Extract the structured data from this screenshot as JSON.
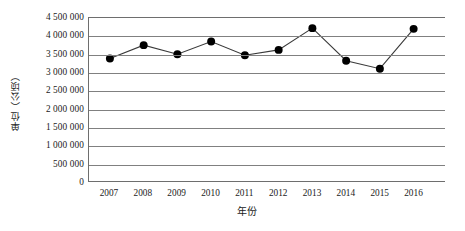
{
  "chart_data": {
    "type": "line",
    "title": "",
    "xlabel": "年份",
    "ylabel": "单位（公顷）",
    "categories": [
      "2007",
      "2008",
      "2009",
      "2010",
      "2011",
      "2012",
      "2013",
      "2014",
      "2015",
      "2016"
    ],
    "values": [
      3380000,
      3750000,
      3500000,
      3850000,
      3470000,
      3620000,
      4220000,
      3320000,
      3100000,
      4200000
    ],
    "series": [
      {
        "name": "面积",
        "values": [
          3380000,
          3750000,
          3500000,
          3850000,
          3470000,
          3620000,
          4220000,
          3320000,
          3100000,
          4200000
        ]
      }
    ],
    "ylim": [
      0,
      4500000
    ],
    "ytick_values": [
      0,
      500000,
      1000000,
      1500000,
      2000000,
      2500000,
      3000000,
      3500000,
      4000000,
      4500000
    ],
    "ytick_labels": [
      "0",
      "500 000",
      "1 000 000",
      "1 500 000",
      "2 000 000",
      "2 500 000",
      "3 000 000",
      "3 500 000",
      "4 000 000",
      "4 500 000"
    ],
    "grid": true,
    "grid_axis": "y",
    "legend": false,
    "legend_position": "none",
    "marker": "circle",
    "marker_color": "#000000",
    "line_color": "#3a3a3a",
    "grid_color": "#808080",
    "plot_border_color": "#6e6e6e",
    "background": "#ffffff"
  }
}
